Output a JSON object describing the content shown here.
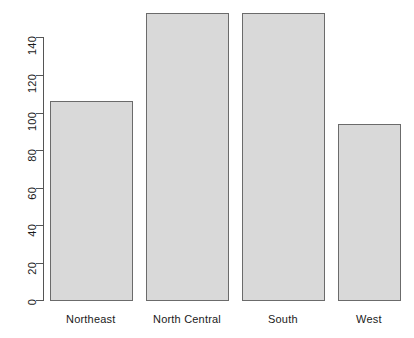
{
  "chart_data": {
    "type": "bar",
    "title": "",
    "subtitle": "",
    "xlabel": "",
    "ylabel": "",
    "categories": [
      "Northeast",
      "North Central",
      "South",
      "West"
    ],
    "values": [
      106,
      153,
      153,
      94
    ],
    "series": [
      {
        "name": "",
        "values": [
          106,
          153,
          153,
          94
        ]
      }
    ],
    "ylim": [
      0,
      153
    ],
    "y_axis_ticks": [
      0,
      20,
      40,
      60,
      80,
      100,
      120,
      140
    ],
    "y_tick_labels": [
      "0",
      "20",
      "40",
      "60",
      "80",
      "100",
      "120",
      "140"
    ],
    "x_tick_labels": [
      "Northeast",
      "North Central",
      "South",
      "West"
    ],
    "grid": false,
    "legend": false,
    "legend_position": "none",
    "bar_fill_color": "#d9d9d9",
    "bar_border_color": "#6b6b6b",
    "axis_color": "#555555",
    "text_color": "#1a1a1a",
    "background_color": "#ffffff",
    "y_tick_label_orientation": "vertical",
    "annotations": []
  },
  "bars": [
    {
      "label": "Northeast",
      "value": 106,
      "left": 50,
      "width": 83,
      "top": 101,
      "height": 200
    },
    {
      "label": "North Central",
      "value": 153,
      "left": 146,
      "width": 83,
      "top": 13,
      "height": 288
    },
    {
      "label": "South",
      "value": 153,
      "left": 242,
      "width": 83,
      "top": 13,
      "height": 288
    },
    {
      "label": "West",
      "value": 94,
      "left": 338,
      "width": 63,
      "top": 124,
      "height": 177
    }
  ],
  "y_ticks": [
    {
      "label": "0",
      "value": 0,
      "y": 300
    },
    {
      "label": "20",
      "value": 20,
      "y": 263
    },
    {
      "label": "40",
      "value": 40,
      "y": 225
    },
    {
      "label": "60",
      "value": 60,
      "y": 188
    },
    {
      "label": "80",
      "value": 80,
      "y": 150
    },
    {
      "label": "100",
      "value": 100,
      "y": 113
    },
    {
      "label": "120",
      "value": 120,
      "y": 75
    },
    {
      "label": "140",
      "value": 140,
      "y": 37
    }
  ],
  "x_labels": [
    {
      "label": "Northeast",
      "center": 91
    },
    {
      "label": "North Central",
      "center": 187
    },
    {
      "label": "South",
      "center": 283
    },
    {
      "label": "West",
      "center": 369
    }
  ]
}
